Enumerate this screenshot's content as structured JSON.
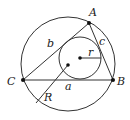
{
  "diagram": {
    "points": {
      "A": {
        "label": "A",
        "x": 89,
        "y": 23
      },
      "B": {
        "label": "B",
        "x": 113,
        "y": 80
      },
      "C": {
        "label": "C",
        "x": 23,
        "y": 80
      }
    },
    "circumcircle": {
      "cx": 68,
      "cy": 64,
      "r": 47
    },
    "circumcenter": {
      "x": 68,
      "y": 65
    },
    "incircle": {
      "cx": 80,
      "cy": 58,
      "r": 21
    },
    "incenter": {
      "x": 80,
      "y": 58
    },
    "labels": {
      "A": "A",
      "B": "B",
      "C": "C",
      "a": "a",
      "b": "b",
      "c": "c",
      "r": "r",
      "R": "R"
    },
    "colors": {
      "line": "#333333",
      "background": "#ffffff"
    }
  }
}
